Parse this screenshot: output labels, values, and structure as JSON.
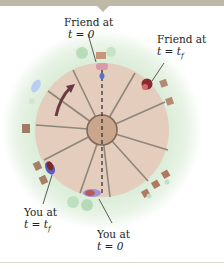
{
  "figure": {
    "type": "merry-go-round top view",
    "labels": {
      "friend_t0": {
        "line1": "Friend at",
        "line2": "t = 0"
      },
      "friend_tf": {
        "line1": "Friend at",
        "line2": "t = t_f"
      },
      "you_tf": {
        "line1": "You at",
        "line2": "t = t_f"
      },
      "you_t0": {
        "line1": "You at",
        "line2": "t = 0"
      }
    },
    "rotation_direction": "counterclockwise",
    "spokes": 10,
    "colors": {
      "ground": "#dfeedd",
      "disk": "#e4cdbd",
      "hub": "#c9a68c",
      "spoke": "#8f8679",
      "path_dash": "#3a3030",
      "arrow": "#6a3a42",
      "topbar": "#bdb9a6"
    }
  }
}
